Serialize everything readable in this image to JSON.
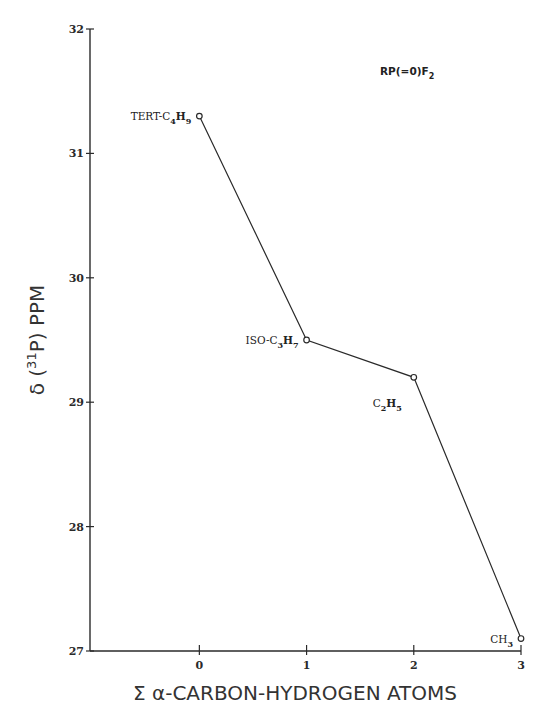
{
  "chart_data": {
    "type": "line",
    "title": "",
    "annotation": {
      "text": "RP(=0)F",
      "subscript": "2"
    },
    "xlabel": "Σ α-CARBON-HYDROGEN ATOMS",
    "ylabel": {
      "prefix": "δ (",
      "superscript": "31",
      "suffix": "P)  PPM"
    },
    "xlim": [
      -1.02,
      3
    ],
    "ylim": [
      27,
      32
    ],
    "x_ticks": [
      0,
      1,
      2,
      3
    ],
    "y_ticks": [
      27,
      28,
      29,
      30,
      31,
      32
    ],
    "grid": false,
    "legend": null,
    "series": [
      {
        "name": "RP(=O)F2",
        "points": [
          {
            "x": 0,
            "y": 31.3,
            "label": "TERT-C",
            "sub1": "4",
            "mid": "H",
            "sub2": "9",
            "label_side": "left"
          },
          {
            "x": 1,
            "y": 29.5,
            "label": "ISO-C",
            "sub1": "3",
            "mid": "H",
            "sub2": "7",
            "label_side": "left"
          },
          {
            "x": 2,
            "y": 29.2,
            "label": "C",
            "sub1": "2",
            "mid": "H",
            "sub2": "5",
            "label_side": "below-left"
          },
          {
            "x": 3,
            "y": 27.1,
            "label": "CH",
            "sub1": "3",
            "mid": "",
            "sub2": "",
            "label_side": "left"
          }
        ]
      }
    ]
  },
  "colors": {
    "ink": "#2a2a2a",
    "background": "#ffffff"
  }
}
